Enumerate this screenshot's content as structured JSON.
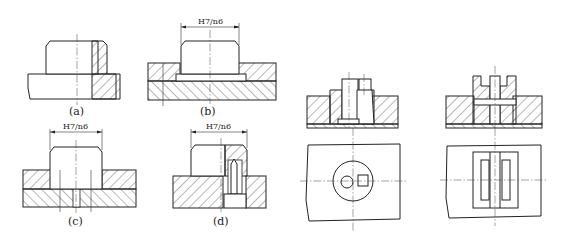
{
  "figure": {
    "views": [
      {
        "id": "a",
        "label": "(a)"
      },
      {
        "id": "b",
        "label": "(b)",
        "fit": "H7/n6"
      },
      {
        "id": "c",
        "label": "(c)",
        "fit": "H7/n6"
      },
      {
        "id": "d",
        "label": "(d)",
        "fit": "H7/n6"
      },
      {
        "id": "e",
        "label": ""
      },
      {
        "id": "f",
        "label": ""
      }
    ]
  }
}
